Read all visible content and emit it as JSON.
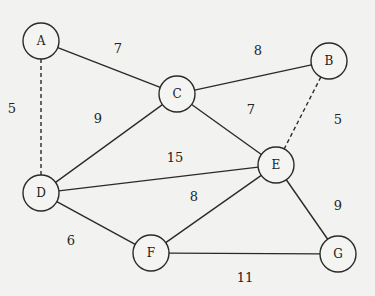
{
  "graph": {
    "nodes": [
      {
        "id": "A",
        "label": "A"
      },
      {
        "id": "B",
        "label": "B"
      },
      {
        "id": "C",
        "label": "C"
      },
      {
        "id": "D",
        "label": "D"
      },
      {
        "id": "E",
        "label": "E"
      },
      {
        "id": "F",
        "label": "F"
      },
      {
        "id": "G",
        "label": "G"
      }
    ],
    "edges": [
      {
        "from": "A",
        "to": "C",
        "weight": "7",
        "style": "solid"
      },
      {
        "from": "A",
        "to": "D",
        "weight": "5",
        "style": "dashed"
      },
      {
        "from": "C",
        "to": "B",
        "weight": "8",
        "style": "solid"
      },
      {
        "from": "C",
        "to": "D",
        "weight": "9",
        "style": "solid"
      },
      {
        "from": "C",
        "to": "E",
        "weight": "7",
        "style": "solid"
      },
      {
        "from": "B",
        "to": "E",
        "weight": "5",
        "style": "dashed"
      },
      {
        "from": "D",
        "to": "E",
        "weight": "15",
        "style": "solid"
      },
      {
        "from": "D",
        "to": "F",
        "weight": "6",
        "style": "solid"
      },
      {
        "from": "F",
        "to": "E",
        "weight": "8",
        "style": "solid"
      },
      {
        "from": "E",
        "to": "G",
        "weight": "9",
        "style": "solid"
      },
      {
        "from": "F",
        "to": "G",
        "weight": "11",
        "style": "solid"
      }
    ]
  }
}
